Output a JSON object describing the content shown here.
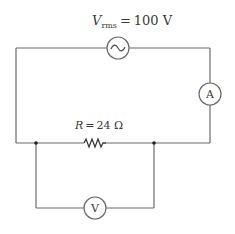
{
  "source_label": {
    "symbol": "V",
    "subscript": "rms",
    "equals": "=",
    "value": "100 V"
  },
  "resistor_label": {
    "symbol": "R",
    "equals": "=",
    "value": "24 Ω"
  },
  "ammeter": {
    "glyph": "A"
  },
  "voltmeter": {
    "glyph": "V"
  },
  "ac_source": {
    "glyph": "~"
  },
  "colors": {
    "wire": "#6a6a6a",
    "text": "#3a3a3a",
    "background": "#ffffff"
  }
}
